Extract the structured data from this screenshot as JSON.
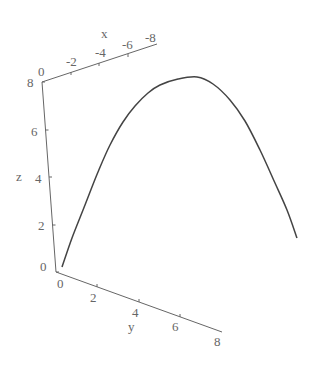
{
  "chart_data": {
    "type": "line",
    "subtype": "3d-parametric-curve",
    "title": "",
    "axes": {
      "x": {
        "label": "x",
        "ticks": [
          "0",
          "-2",
          "-4",
          "-6",
          "-8"
        ],
        "range": [
          0,
          -8
        ]
      },
      "y": {
        "label": "y",
        "ticks": [
          "0",
          "2",
          "4",
          "6",
          "8"
        ],
        "range": [
          0,
          8
        ]
      },
      "z": {
        "label": "z",
        "ticks": [
          "0",
          "2",
          "4",
          "6",
          "8"
        ],
        "range": [
          0,
          8
        ]
      }
    },
    "series": [
      {
        "name": "trajectory",
        "description": "Parabolic arc rising from origin (z=0) to a maximum near z≈8 and descending",
        "approx_z_peak": 8,
        "screen_points": [
          [
            62,
            267
          ],
          [
            72,
            238
          ],
          [
            85,
            205
          ],
          [
            98,
            172
          ],
          [
            110,
            145
          ],
          [
            123,
            122
          ],
          [
            135,
            106
          ],
          [
            148,
            93
          ],
          [
            160,
            85
          ],
          [
            178,
            79
          ],
          [
            197,
            77
          ],
          [
            213,
            84
          ],
          [
            230,
            100
          ],
          [
            245,
            121
          ],
          [
            260,
            150
          ],
          [
            275,
            183
          ],
          [
            287,
            210
          ],
          [
            297,
            238
          ]
        ]
      }
    ],
    "grid": false,
    "legend": false
  },
  "labels": {
    "x_axis": "x",
    "y_axis": "y",
    "z_axis": "z",
    "x_ticks": [
      "0",
      "-2",
      "-4",
      "-6",
      "-8"
    ],
    "y_ticks": [
      "0",
      "2",
      "4",
      "6",
      "8"
    ],
    "z_ticks": [
      "0",
      "2",
      "4",
      "6",
      "8"
    ]
  }
}
